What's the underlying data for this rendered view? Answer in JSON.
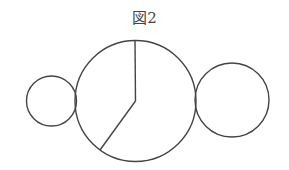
{
  "figure": {
    "title": "図2",
    "stroke_color": "#444444",
    "background": "#ffffff",
    "circles": [
      {
        "name": "left-small-circle",
        "cx": 51.5,
        "cy": 101,
        "r": 25
      },
      {
        "name": "center-large-circle",
        "cx": 135.5,
        "cy": 101,
        "r": 60.5
      },
      {
        "name": "right-medium-circle",
        "cx": 232,
        "cy": 100,
        "r": 37
      }
    ],
    "radii_lines": [
      {
        "name": "vertical-radius",
        "x1": 135,
        "y1": 40.5,
        "x2": 135.5,
        "y2": 101
      },
      {
        "name": "diagonal-radius",
        "x1": 135.5,
        "y1": 101,
        "x2": 100,
        "y2": 150
      }
    ]
  }
}
